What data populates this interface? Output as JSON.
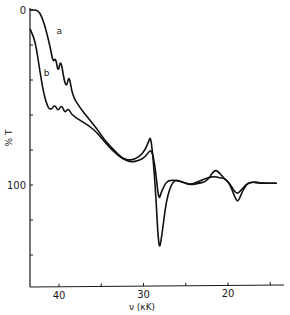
{
  "chart_data": {
    "type": "line",
    "title": "",
    "xlabel": "ν (κK)",
    "ylabel": "% T",
    "xlim": [
      43.5,
      13.5
    ],
    "ylim": [
      0,
      160
    ],
    "x_reversed": true,
    "y_reversed": true,
    "grid": false,
    "legend": "inline curve labels",
    "x_ticks": [
      40,
      35,
      30,
      25,
      20,
      15
    ],
    "x_tick_labels": [
      "40",
      "",
      "30",
      "",
      "20",
      ""
    ],
    "y_ticks": [
      0,
      20,
      40,
      60,
      80,
      100,
      120,
      140
    ],
    "y_tick_labels": [
      "0",
      "",
      "",
      "",
      "",
      "100",
      "",
      ""
    ],
    "series": [
      {
        "name": "a",
        "x": [
          43.4,
          42.5,
          42.0,
          41.5,
          41.0,
          40.7,
          40.4,
          40.1,
          39.8,
          39.4,
          39.1,
          38.8,
          38.4,
          37.5,
          36.5,
          35.5,
          34.5,
          33.5,
          32.5,
          31.5,
          30.5,
          29.8,
          29.4,
          29.1,
          28.6,
          28.2,
          27.9,
          27.3,
          26.5,
          25.5,
          24.5,
          23.5,
          22.5,
          21.6,
          21.0,
          20.5,
          19.8,
          19.2,
          18.8,
          18.3,
          17.5,
          16.0,
          14.3
        ],
        "y": [
          0,
          0,
          4,
          12,
          22,
          30,
          27,
          36,
          28,
          40,
          44,
          37,
          49,
          56,
          62,
          68,
          75,
          80,
          85,
          86,
          84,
          80,
          75,
          72,
          100,
          137,
          132,
          108,
          97,
          98,
          100,
          99,
          98,
          91,
          93,
          96,
          99,
          107,
          110,
          103,
          98,
          99,
          99
        ]
      },
      {
        "name": "b",
        "x": [
          43.4,
          42.8,
          42.3,
          41.8,
          41.3,
          40.9,
          40.5,
          40.1,
          39.7,
          39.3,
          38.9,
          38.5,
          37.5,
          36.5,
          35.5,
          34.5,
          33.5,
          32.5,
          31.5,
          30.5,
          29.8,
          29.4,
          29.0,
          28.6,
          28.2,
          27.9,
          27.3,
          26.5,
          25.5,
          24.5,
          23.5,
          22.5,
          21.6,
          21.0,
          20.5,
          19.8,
          19.2,
          18.8,
          18.3,
          17.5,
          16.0,
          14.3
        ],
        "y": [
          11,
          18,
          34,
          48,
          56,
          57,
          54,
          58,
          54,
          59,
          56,
          60,
          63,
          66,
          70,
          76,
          81,
          85,
          87,
          86,
          84,
          81,
          80,
          90,
          109,
          104,
          98,
          97,
          98,
          100,
          98,
          96,
          95,
          96,
          96,
          99,
          104,
          105,
          102,
          98,
          99,
          99
        ]
      }
    ],
    "annotations": [
      {
        "text": "a",
        "x": 40.3,
        "y": 12
      },
      {
        "text": "b",
        "x": 41.8,
        "y": 36
      }
    ]
  },
  "axes": {
    "x_label": "ν (κK)",
    "y_label": "% T",
    "curve_a_label": "a",
    "curve_b_label": "b"
  }
}
